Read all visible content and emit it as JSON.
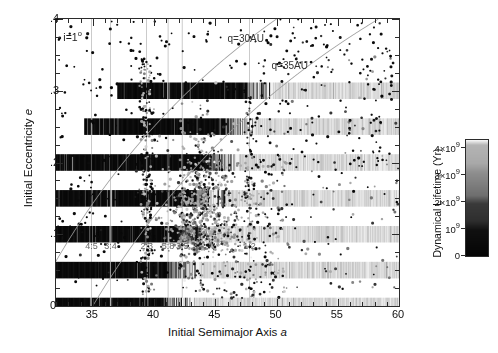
{
  "chart_data": {
    "type": "scatter",
    "title": "",
    "xlabel": "Initial Semimajor Axis a",
    "ylabel": "Initial Eccentricity e",
    "xlim": [
      32,
      60
    ],
    "ylim": [
      0,
      0.4
    ],
    "xticks": [
      35,
      40,
      45,
      50,
      55,
      60
    ],
    "xticklabels": [
      "35",
      "40",
      "45",
      "50",
      "55",
      "60"
    ],
    "xminorstep": 1,
    "yticks": [
      0,
      0.1,
      0.2,
      0.3,
      0.4
    ],
    "yticklabels": [
      "0",
      ".1",
      ".2",
      ".3",
      ".4"
    ],
    "yminorstep": 0.025,
    "grid": false,
    "legend_position": "none",
    "annotations": [
      {
        "name": "inclination",
        "text": "i=1",
        "sup": "o",
        "x": 32.6,
        "y": 0.378
      },
      {
        "name": "perihelion-30au",
        "text": "q=30AU",
        "x": 46.0,
        "y": 0.372
      },
      {
        "name": "perihelion-35au",
        "text": "q=35AU",
        "x": 49.6,
        "y": 0.335
      }
    ],
    "perihelion_curves": [
      {
        "name": "q=30AU",
        "q": 30,
        "color": "#9a9a9a"
      },
      {
        "name": "q=35AU",
        "q": 35,
        "color": "#9a9a9a"
      }
    ],
    "resonances": [
      {
        "label": "4:5",
        "a": 34.9,
        "y": 0.083
      },
      {
        "label": "3:4",
        "a": 36.45,
        "y": 0.083
      },
      {
        "label": "2:3",
        "a": 39.4,
        "y": 0.083
      },
      {
        "label": "5:8",
        "a": 41.15,
        "y": 0.083
      },
      {
        "label": "3:5",
        "a": 42.3,
        "y": 0.083
      },
      {
        "label": "1:2",
        "a": 47.8,
        "y": 0.083
      }
    ],
    "resonance_lines": [
      34.9,
      36.45,
      39.4,
      41.15,
      42.3,
      47.8
    ],
    "band_rows": [
      {
        "e": 0.0,
        "a_start": 32.0,
        "a_dark_end": 41.9,
        "a_fade_end": 60.0
      },
      {
        "e": 0.05,
        "a_start": 32.0,
        "a_dark_end": 42.4,
        "a_fade_end": 60.0
      },
      {
        "e": 0.1,
        "a_start": 32.0,
        "a_dark_end": 43.1,
        "a_fade_end": 60.0
      },
      {
        "e": 0.15,
        "a_start": 32.0,
        "a_dark_end": 44.6,
        "a_fade_end": 60.0
      },
      {
        "e": 0.2,
        "a_start": 32.0,
        "a_dark_end": 45.6,
        "a_fade_end": 60.0
      },
      {
        "e": 0.25,
        "a_start": 34.3,
        "a_dark_end": 46.9,
        "a_fade_end": 60.0
      },
      {
        "e": 0.3,
        "a_start": 37.0,
        "a_dark_end": 48.4,
        "a_fade_end": 60.0
      }
    ],
    "band_half_height": 0.0115,
    "colorbar": {
      "title": "Dynamical Lifetime (Yr)",
      "vmin": 0,
      "vmax": 4300000000.0,
      "ticks": [
        0,
        1000000000.0,
        2000000000.0,
        3000000000.0,
        4000000000.0
      ],
      "ticklabels": [
        "0",
        "10",
        "2×10",
        "3×10",
        "4×10"
      ],
      "tick_exponent": "9",
      "colormap": "grayscale-reversed",
      "stops": [
        {
          "v": 0.0,
          "color": "#050505"
        },
        {
          "v": 0.22,
          "color": "#101010"
        },
        {
          "v": 0.3,
          "color": "#2e2e2e"
        },
        {
          "v": 0.45,
          "color": "#3a3a3a"
        },
        {
          "v": 0.52,
          "color": "#6e6e6e"
        },
        {
          "v": 0.72,
          "color": "#8e8e8e"
        },
        {
          "v": 0.8,
          "color": "#a8a8a8"
        },
        {
          "v": 0.96,
          "color": "#b4b4b4"
        },
        {
          "v": 1.0,
          "color": "#f2f2f2"
        }
      ]
    },
    "series": [
      {
        "name": "particles",
        "marker": "circle",
        "size": 2,
        "note": "scattered test particles shaded by dynamical lifetime"
      }
    ]
  },
  "figure": {
    "background": "#ffffff",
    "axis_color": "#2b2b2b",
    "curve_color": "#9a9a9a",
    "resonance_line_color": "#b5b5b5",
    "resonance_label_color": "#666666"
  }
}
